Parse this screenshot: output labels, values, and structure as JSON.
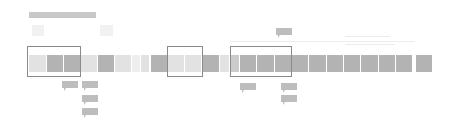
{
  "diagram": {
    "title_bar": {
      "x": 29,
      "y": 12,
      "w": 67,
      "h": 6,
      "color": "#c8c8c8"
    },
    "ghost_icons": [
      {
        "name": "ghost-square-left",
        "x": 32,
        "y": 25,
        "w": 12,
        "h": 11
      },
      {
        "name": "ghost-square-right",
        "x": 100,
        "y": 25,
        "w": 13,
        "h": 11
      }
    ],
    "faint_guides": [
      {
        "name": "faint-guide-line",
        "x": 230,
        "y": 41,
        "w": 185,
        "h": 1
      },
      {
        "name": "faint-text-line-1",
        "x": 345,
        "y": 36,
        "w": 45,
        "h": 1
      },
      {
        "name": "faint-text-line-2",
        "x": 345,
        "y": 44,
        "w": 50,
        "h": 1
      }
    ],
    "colors": {
      "dark": "#b3b3b3",
      "mid": "#cbcbcb",
      "light": "#e2e2e2",
      "pale": "#eeeeee",
      "border": "#8a8a8a",
      "callout": "#bdbdbd"
    },
    "blocks": [
      {
        "x": 29,
        "w": 17,
        "shade": "light"
      },
      {
        "x": 47,
        "w": 16,
        "shade": "dark"
      },
      {
        "x": 64,
        "w": 16,
        "shade": "dark"
      },
      {
        "x": 81,
        "w": 16,
        "shade": "light"
      },
      {
        "x": 98,
        "w": 16,
        "shade": "dark"
      },
      {
        "x": 115,
        "w": 16,
        "shade": "light"
      },
      {
        "x": 132,
        "w": 8,
        "shade": "pale"
      },
      {
        "x": 141,
        "w": 8,
        "shade": "light"
      },
      {
        "x": 151,
        "w": 16,
        "shade": "dark"
      },
      {
        "x": 168,
        "w": 16,
        "shade": "light"
      },
      {
        "x": 185,
        "w": 16,
        "shade": "light"
      },
      {
        "x": 203,
        "w": 16,
        "shade": "dark"
      },
      {
        "x": 220,
        "w": 9,
        "shade": "light"
      },
      {
        "x": 230,
        "w": 9,
        "shade": "mid"
      },
      {
        "x": 240,
        "w": 16,
        "shade": "dark"
      },
      {
        "x": 257,
        "w": 17,
        "shade": "dark"
      },
      {
        "x": 275,
        "w": 16,
        "shade": "dark"
      },
      {
        "x": 292,
        "w": 16,
        "shade": "dark"
      },
      {
        "x": 309,
        "w": 17,
        "shade": "dark"
      },
      {
        "x": 327,
        "w": 16,
        "shade": "dark"
      },
      {
        "x": 344,
        "w": 16,
        "shade": "dark"
      },
      {
        "x": 361,
        "w": 17,
        "shade": "dark"
      },
      {
        "x": 379,
        "w": 16,
        "shade": "dark"
      },
      {
        "x": 396,
        "w": 16,
        "shade": "dark"
      },
      {
        "x": 416,
        "w": 16,
        "shade": "dark"
      }
    ],
    "span_boxes": [
      {
        "name": "highlight-span-1",
        "x": 27,
        "y": 46,
        "w": 54,
        "h": 31
      },
      {
        "name": "highlight-span-2",
        "x": 167,
        "y": 46,
        "w": 36,
        "h": 31
      },
      {
        "name": "highlight-span-3",
        "x": 230,
        "y": 46,
        "w": 62,
        "h": 31
      }
    ],
    "callouts": [
      {
        "name": "callout-top",
        "x": 276,
        "y": 28,
        "label": ""
      },
      {
        "name": "callout-span1-a",
        "x": 62,
        "y": 81,
        "label": ""
      },
      {
        "name": "callout-span1-b",
        "x": 82,
        "y": 81,
        "label": ""
      },
      {
        "name": "callout-span1-c",
        "x": 82,
        "y": 95,
        "label": ""
      },
      {
        "name": "callout-span1-d",
        "x": 82,
        "y": 108,
        "label": ""
      },
      {
        "name": "callout-span3-a",
        "x": 240,
        "y": 83,
        "label": ""
      },
      {
        "name": "callout-span3-b",
        "x": 281,
        "y": 83,
        "label": ""
      },
      {
        "name": "callout-span3-c",
        "x": 281,
        "y": 95,
        "label": ""
      }
    ]
  }
}
